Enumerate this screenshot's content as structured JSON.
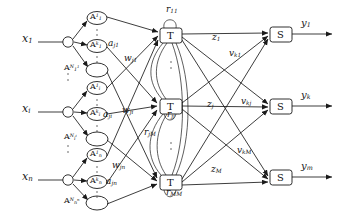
{
  "diagram": {
    "inputs": [
      {
        "id": "x1",
        "label_base": "x",
        "label_sub": "1",
        "x": 22,
        "y": 38,
        "node_x": 68,
        "node_y": 42
      },
      {
        "id": "xi",
        "label_base": "x",
        "label_sub": "i",
        "x": 22,
        "y": 108,
        "node_x": 68,
        "node_y": 112
      },
      {
        "id": "xn",
        "label_base": "x",
        "label_sub": "n",
        "x": 22,
        "y": 176,
        "node_x": 68,
        "node_y": 180
      }
    ],
    "membership_nodes": [
      {
        "id": "A_1_1",
        "base": "A",
        "sub": "1",
        "sup": "1",
        "cx": 97,
        "cy": 18
      },
      {
        "id": "A_1_k",
        "base": "A",
        "sub": "1",
        "sup": "k",
        "cx": 97,
        "cy": 46
      },
      {
        "id": "A_1_N1",
        "base": "A",
        "sub": "1",
        "sup": "N",
        "sup2": "1",
        "cx": 97,
        "cy": 70
      },
      {
        "id": "A_i_1",
        "base": "A",
        "sub": "i",
        "sup": "1",
        "cx": 97,
        "cy": 88
      },
      {
        "id": "A_i_k",
        "base": "A",
        "sub": "i",
        "sup": "k",
        "cx": 97,
        "cy": 114
      },
      {
        "id": "A_i_Ni",
        "base": "A",
        "sub": "i",
        "sup": "N",
        "sup2": "i",
        "cx": 97,
        "cy": 139
      },
      {
        "id": "A_n_1",
        "base": "A",
        "sub": "n",
        "sup": "1",
        "cx": 97,
        "cy": 155
      },
      {
        "id": "A_n_k",
        "base": "A",
        "sub": "n",
        "sup": "k",
        "cx": 97,
        "cy": 182
      },
      {
        "id": "A_n_Nn",
        "base": "A",
        "sub": "n",
        "sup": "N",
        "sup2": "n",
        "cx": 97,
        "cy": 203
      }
    ],
    "rule_nodes": [
      {
        "id": "T1",
        "label": "T",
        "x": 160,
        "y": 28,
        "w": 22,
        "h": 15
      },
      {
        "id": "Tj",
        "label": "T",
        "x": 160,
        "y": 99,
        "w": 22,
        "h": 15
      },
      {
        "id": "TM",
        "label": "T",
        "x": 160,
        "y": 175,
        "w": 22,
        "h": 15
      }
    ],
    "output_nodes": [
      {
        "id": "S1",
        "label": "S",
        "x": 270,
        "y": 27,
        "w": 22,
        "h": 15
      },
      {
        "id": "Sk",
        "label": "S",
        "x": 270,
        "y": 99,
        "w": 22,
        "h": 15
      },
      {
        "id": "Sm",
        "label": "S",
        "x": 270,
        "y": 170,
        "w": 22,
        "h": 15
      }
    ],
    "outputs": [
      {
        "id": "y1",
        "base": "y",
        "sub": "1",
        "x": 303,
        "y": 14
      },
      {
        "id": "yk",
        "base": "y",
        "sub": "k",
        "x": 303,
        "y": 86
      },
      {
        "id": "ym",
        "base": "y",
        "sub": "m",
        "x": 303,
        "y": 157
      }
    ],
    "edge_labels": [
      {
        "id": "a_j1",
        "base": "a",
        "sub": "j1",
        "x": 110,
        "y": 42
      },
      {
        "id": "w_j1",
        "base": "w",
        "sub": "j1",
        "x": 125,
        "y": 58
      },
      {
        "id": "a_ji",
        "base": "a",
        "sub": "ji",
        "x": 104,
        "y": 113
      },
      {
        "id": "w_ji",
        "base": "w",
        "sub": "ji",
        "x": 124,
        "y": 110
      },
      {
        "id": "w_jn",
        "base": "w",
        "sub": "jn",
        "x": 113,
        "y": 165
      },
      {
        "id": "a_jn",
        "base": "a",
        "sub": "jn",
        "x": 107,
        "y": 181
      },
      {
        "id": "r_11",
        "base": "r",
        "sub": "11",
        "x": 167,
        "y": 10
      },
      {
        "id": "r_jj",
        "base": "r",
        "sub": "jj",
        "x": 168,
        "y": 113
      },
      {
        "id": "r_jM",
        "base": "r",
        "sub": "jM",
        "x": 146,
        "y": 133
      },
      {
        "id": "r_MM",
        "base": "r",
        "sub": "MM",
        "x": 168,
        "y": 190
      },
      {
        "id": "z_1",
        "base": "z",
        "sub": "1",
        "x": 213,
        "y": 38
      },
      {
        "id": "z_j",
        "base": "z",
        "sub": "j",
        "x": 208,
        "y": 104
      },
      {
        "id": "z_M",
        "base": "z",
        "sub": "M",
        "x": 212,
        "y": 170
      },
      {
        "id": "v_k1",
        "base": "v",
        "sub": "k1",
        "x": 231,
        "y": 54
      },
      {
        "id": "v_kj",
        "base": "v",
        "sub": "kj",
        "x": 242,
        "y": 101
      },
      {
        "id": "v_kM",
        "base": "v",
        "sub": "kM",
        "x": 239,
        "y": 151
      }
    ],
    "colors": {
      "stroke": "#1a1a1a",
      "text": "#151515",
      "paper": "#ffffff"
    }
  }
}
